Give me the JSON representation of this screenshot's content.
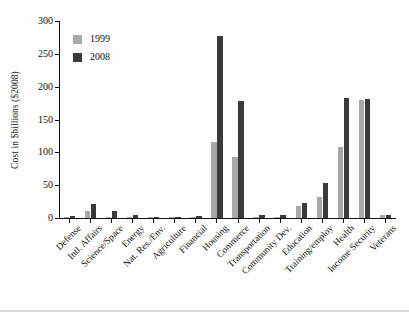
{
  "chart_data": {
    "type": "bar",
    "title": "",
    "xlabel": "",
    "ylabel": "Cost in $billions ($2008)",
    "ylim": [
      0,
      300
    ],
    "yticks": [
      0,
      50,
      100,
      150,
      200,
      250,
      300
    ],
    "grid": false,
    "legend_position": "top-left-inside",
    "categories": [
      "Defense",
      "Intl. Affairs",
      "Science/Space",
      "Energy",
      "Nat. Res./Env.",
      "Agriculture",
      "Financial",
      "Housing",
      "Commerce",
      "Transportation",
      "Community Dev.",
      "Education",
      "Training/employ",
      "Health",
      "Income Security",
      "Veterans"
    ],
    "series": [
      {
        "name": "1999",
        "color": "#a8a8a8",
        "values": [
          2,
          11,
          1,
          1,
          1,
          1,
          1,
          116,
          93,
          1,
          1,
          18,
          32,
          108,
          180,
          5
        ]
      },
      {
        "name": "2008",
        "color": "#3a3a3a",
        "values": [
          3,
          21,
          11,
          5,
          2,
          1,
          3,
          277,
          178,
          4,
          4,
          23,
          53,
          183,
          181,
          5
        ]
      }
    ]
  },
  "axis": {
    "y_title": "Cost in $billions ($2008)",
    "y_tick_labels": [
      "0",
      "50",
      "100",
      "150",
      "200",
      "250",
      "300"
    ]
  },
  "legend": {
    "entries": [
      {
        "label": "1999",
        "color": "#a8a8a8"
      },
      {
        "label": "2008",
        "color": "#3a3a3a"
      }
    ]
  }
}
